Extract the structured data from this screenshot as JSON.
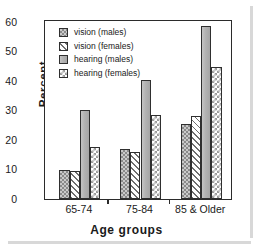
{
  "chart_data": {
    "type": "bar",
    "title": "",
    "xlabel": "Age groups",
    "ylabel": "Percent",
    "categories": [
      "65-74",
      "75-84",
      "85 & Older"
    ],
    "ylim": [
      0,
      60
    ],
    "yticks": [
      0,
      10,
      20,
      30,
      40,
      50,
      60
    ],
    "ytick_labels": [
      "0",
      "10",
      "20",
      "30",
      "40",
      "50",
      "60"
    ],
    "y_minor_step": 5,
    "grid": false,
    "legend_position": "upper left (inside axes)",
    "series": [
      {
        "name": "vision (males)",
        "pattern": "checker-fine",
        "values": [
          10.0,
          17.0,
          25.5
        ]
      },
      {
        "name": "vision (females)",
        "pattern": "diagonal-hatch",
        "values": [
          9.5,
          16.0,
          28.0
        ]
      },
      {
        "name": "hearing (males)",
        "pattern": "solid-gray",
        "values": [
          30.2,
          40.3,
          58.5
        ]
      },
      {
        "name": "hearing (females)",
        "pattern": "checker-coarse",
        "values": [
          17.6,
          28.6,
          44.6
        ]
      }
    ]
  },
  "colors": {
    "axis": "#2b2b2b",
    "background": "#ffffff",
    "checker_fine": "#c9c9c9",
    "diagonal_hatch": "#ffffff",
    "solid_gray": "#b0b0b0",
    "checker_coarse": "#ffffff",
    "shadow": "#d8d8d8"
  }
}
